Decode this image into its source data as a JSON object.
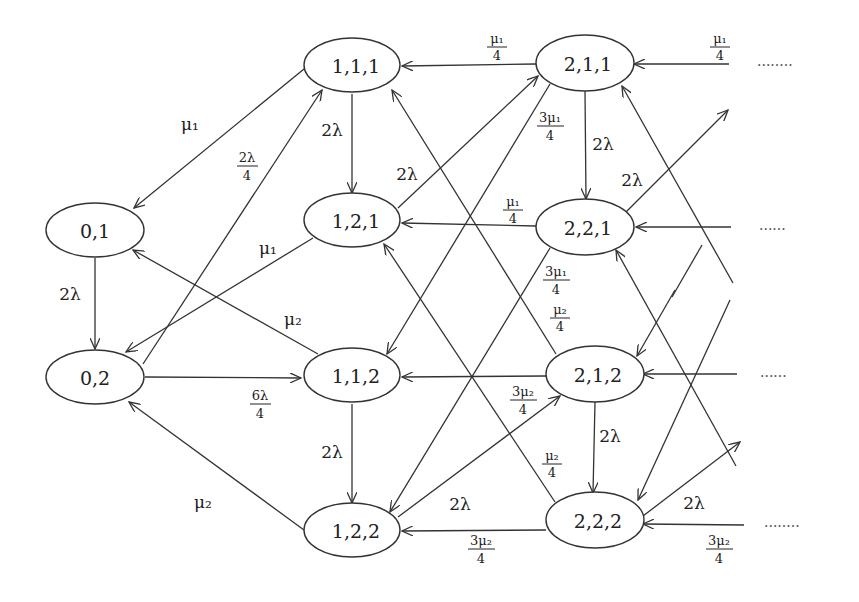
{
  "diagram": {
    "type": "state-transition",
    "nodes": [
      {
        "id": "n01",
        "label": "0,1",
        "x": 95,
        "y": 230
      },
      {
        "id": "n02",
        "label": "0,2",
        "x": 95,
        "y": 380
      },
      {
        "id": "n111",
        "label": "1,1,1",
        "x": 352,
        "y": 67
      },
      {
        "id": "n121",
        "label": "1,2,1",
        "x": 352,
        "y": 222
      },
      {
        "id": "n112",
        "label": "1,1,2",
        "x": 352,
        "y": 378
      },
      {
        "id": "n122",
        "label": "1,2,2",
        "x": 352,
        "y": 532
      },
      {
        "id": "n211",
        "label": "2,1,1",
        "x": 585,
        "y": 63
      },
      {
        "id": "n221",
        "label": "2,2,1",
        "x": 585,
        "y": 228
      },
      {
        "id": "n212",
        "label": "2,1,2",
        "x": 595,
        "y": 375
      },
      {
        "id": "n222",
        "label": "2,2,2",
        "x": 595,
        "y": 523
      }
    ],
    "labels": {
      "mu1": "μ₁",
      "mu2": "μ₂",
      "two_lambda": "2λ",
      "frac_2lambda_num": "2λ",
      "frac_6lambda_num": "6λ",
      "frac_mu1_num": "μ₁",
      "frac_mu2_num": "μ₂",
      "frac_3mu1_num": "3μ₁",
      "frac_3mu2_num": "3μ₂",
      "denominator": "4",
      "ellipsis_long": "........",
      "ellipsis_short": "......"
    },
    "edges": [
      {
        "from": "1,1,1",
        "to": "0,1",
        "label": "μ₁"
      },
      {
        "from": "0,1",
        "to": "0,2",
        "label": "2λ"
      },
      {
        "from": "0,2",
        "to": "1,1,1",
        "label": "2λ/4"
      },
      {
        "from": "1,2,1",
        "to": "0,2",
        "label": "μ₁"
      },
      {
        "from": "1,1,2",
        "to": "0,1",
        "label": "μ₂"
      },
      {
        "from": "0,2",
        "to": "1,1,2",
        "label": "6λ/4"
      },
      {
        "from": "1,2,2",
        "to": "0,2",
        "label": "μ₂"
      },
      {
        "from": "1,1,1",
        "to": "1,2,1",
        "label": "2λ"
      },
      {
        "from": "1,1,2",
        "to": "1,2,2",
        "label": "2λ"
      },
      {
        "from": "2,1,1",
        "to": "1,1,1",
        "label": "μ₁/4"
      },
      {
        "from": "2,2,1",
        "to": "1,2,1",
        "label": "μ₁/4"
      },
      {
        "from": "2,1,2",
        "to": "1,1,2",
        "label": "μ₂/4"
      },
      {
        "from": "2,2,2",
        "to": "1,2,2",
        "label": "3μ₂/4"
      },
      {
        "from": "2,1,1",
        "to": "1,1,2",
        "label": "3μ₁/4"
      },
      {
        "from": "2,2,1",
        "to": "1,2,2",
        "label": "3μ₁/4"
      },
      {
        "from": "2,1,2",
        "to": "1,1,1",
        "label": "μ₂/4"
      },
      {
        "from": "2,2,2",
        "to": "1,2,1",
        "label": "μ₂/4"
      },
      {
        "from": "1,2,1",
        "to": "2,1,1",
        "label": "2λ"
      },
      {
        "from": "1,2,2",
        "to": "2,1,2",
        "label": "2λ"
      },
      {
        "from": "2,1,1",
        "to": "2,2,1",
        "label": "2λ"
      },
      {
        "from": "2,1,2",
        "to": "2,2,2",
        "label": "2λ"
      },
      {
        "from": "...",
        "to": "2,1,1",
        "label": "μ₁/4"
      },
      {
        "from": "...",
        "to": "2,2,1",
        "label": ""
      },
      {
        "from": "...",
        "to": "2,1,2",
        "label": ""
      },
      {
        "from": "...",
        "to": "2,2,2",
        "label": "3μ₂/4"
      },
      {
        "from": "2,2,1",
        "to": "...",
        "label": "2λ"
      },
      {
        "from": "2,2,2",
        "to": "...",
        "label": "2λ"
      }
    ]
  }
}
